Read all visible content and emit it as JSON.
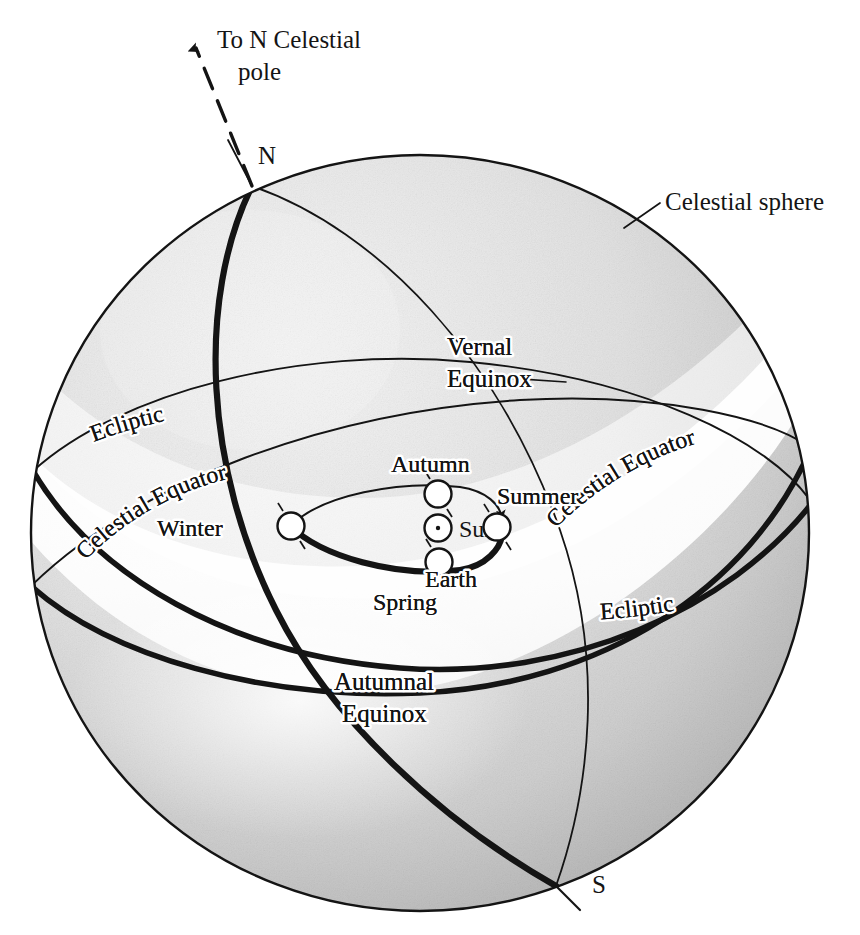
{
  "figure": {
    "background_color": "#ffffff",
    "ink_color": "#141414",
    "sphere_light_shade": "#e6e6e6",
    "sphere_dark_shade": "#adadad"
  },
  "callouts": {
    "north_celestial_pole": "To N Celestial\npole",
    "north_celestial_pole_line1": "To N Celestial",
    "north_celestial_pole_line2": "pole",
    "celestial_sphere": "Celestial sphere",
    "vernal_equinox_line1": "Vernal",
    "vernal_equinox_line2": "Equinox",
    "autumnal_equinox_line1": "Autumnal",
    "autumnal_equinox_line2": "Equinox"
  },
  "poles": {
    "north": "N",
    "south": "S"
  },
  "great_circles": [
    {
      "name": "ecliptic-left",
      "label": "Ecliptic",
      "side": "left",
      "style": "thin"
    },
    {
      "name": "celestial-equator-left",
      "label": "Celestial Equator",
      "side": "left",
      "style": "thin"
    },
    {
      "name": "celestial-equator-right",
      "label": "Celestial Equator",
      "side": "right",
      "style": "thick"
    },
    {
      "name": "ecliptic-right",
      "label": "Ecliptic",
      "side": "right",
      "style": "thick"
    }
  ],
  "orbit": {
    "center_body": "Sun",
    "orbiting_body": "Earth",
    "positions": [
      {
        "season": "Winter",
        "x": 291,
        "y": 526
      },
      {
        "season": "Autumn",
        "x": 438,
        "y": 494
      },
      {
        "season": "Summer",
        "x": 497,
        "y": 527
      },
      {
        "season": "Spring",
        "x": 439,
        "y": 562
      }
    ],
    "sun": {
      "x": 438,
      "y": 528
    },
    "direction": "counterclockwise-as-drawn"
  },
  "labels": {
    "ecliptic": "Ecliptic",
    "celestial_equator": "Celestial Equator",
    "sun": "Sun",
    "earth": "Earth",
    "winter": "Winter",
    "autumn": "Autumn",
    "summer": "Summer",
    "spring": "Spring"
  }
}
